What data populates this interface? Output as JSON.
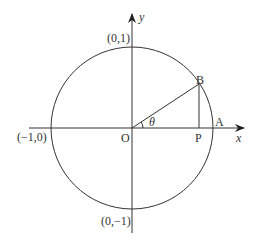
{
  "diagram": {
    "type": "unit-circle",
    "stroke_color": "#333333",
    "background": "#ffffff",
    "axes": {
      "x_label": "x",
      "y_label": "y"
    },
    "points": {
      "origin": "O",
      "B": "B",
      "P": "P",
      "A": "A"
    },
    "intercepts": {
      "top": "(0,1)",
      "bottom": "(0,−1)",
      "left": "(−1,0)"
    },
    "angle_label": "θ"
  }
}
